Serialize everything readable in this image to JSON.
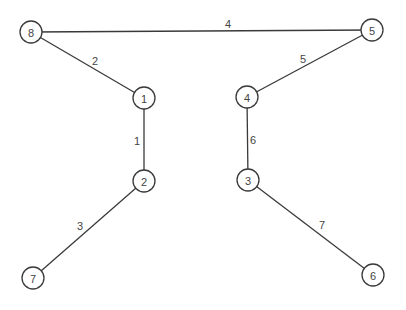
{
  "diagram": {
    "type": "weighted-graph",
    "nodes": [
      {
        "id": "8",
        "label": "8",
        "x": 31,
        "y": 32
      },
      {
        "id": "1",
        "label": "1",
        "x": 144,
        "y": 98
      },
      {
        "id": "2",
        "label": "2",
        "x": 144,
        "y": 181
      },
      {
        "id": "7",
        "label": "7",
        "x": 33,
        "y": 278
      },
      {
        "id": "5",
        "label": "5",
        "x": 372,
        "y": 30
      },
      {
        "id": "4",
        "label": "4",
        "x": 247,
        "y": 97
      },
      {
        "id": "3",
        "label": "3",
        "x": 248,
        "y": 180
      },
      {
        "id": "6",
        "label": "6",
        "x": 373,
        "y": 275
      }
    ],
    "edges": [
      {
        "from": "8",
        "to": "5",
        "label": "4",
        "lx": 228,
        "ly": 24
      },
      {
        "from": "8",
        "to": "1",
        "label": "2",
        "lx": 95,
        "ly": 61
      },
      {
        "from": "1",
        "to": "2",
        "label": "1",
        "lx": 137,
        "ly": 141
      },
      {
        "from": "2",
        "to": "7",
        "label": "3",
        "lx": 80,
        "ly": 226
      },
      {
        "from": "5",
        "to": "4",
        "label": "5",
        "lx": 303,
        "ly": 59
      },
      {
        "from": "4",
        "to": "3",
        "label": "6",
        "lx": 253,
        "ly": 140
      },
      {
        "from": "3",
        "to": "6",
        "label": "7",
        "lx": 322,
        "ly": 225
      }
    ],
    "node_radius": 11,
    "colors": {
      "stroke": "#3a3a3a",
      "text": "#444444",
      "background": "#ffffff"
    }
  }
}
